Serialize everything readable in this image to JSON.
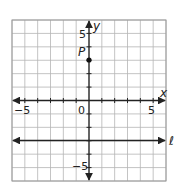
{
  "figure": {
    "type": "coordinate-plane",
    "x_range": [
      -6,
      6
    ],
    "y_range": [
      -6,
      6
    ],
    "grid_step": 1,
    "x_axis_label": "x",
    "y_axis_label": "y",
    "tick_labels": {
      "x_neg": "−5",
      "x_pos": "5",
      "origin": "0",
      "y_pos": "5",
      "y_neg": "−5"
    },
    "point": {
      "label": "P",
      "x": 0,
      "y": 3
    },
    "line": {
      "label": "ℓ",
      "type": "horizontal",
      "y": -3
    },
    "colors": {
      "grid": "#b5b5b5",
      "border": "#9a9a9a",
      "axis": "#222222",
      "point": "#111111"
    }
  }
}
